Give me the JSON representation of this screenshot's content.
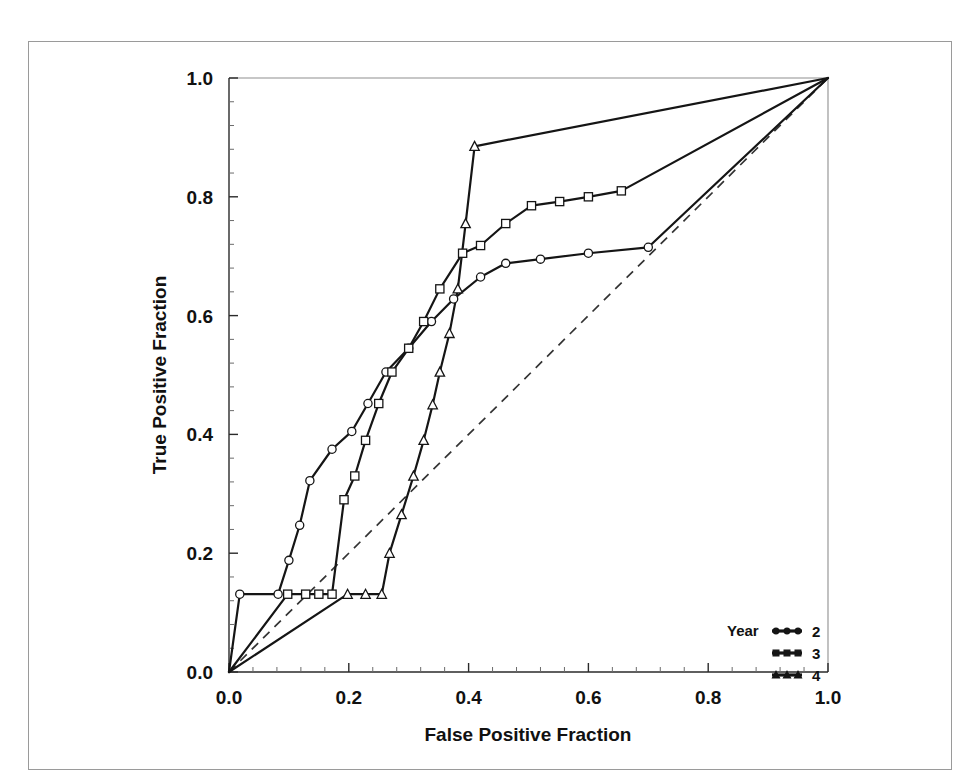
{
  "chart_data": {
    "type": "line",
    "title": "",
    "xlabel": "False Positive Fraction",
    "ylabel": "True Positive Fraction",
    "xlim": [
      0.0,
      1.0
    ],
    "ylim": [
      0.0,
      1.0
    ],
    "grid": false,
    "legend_position": "bottom-right",
    "legend_title": "Year",
    "xticks": [
      "0.0",
      "0.2",
      "0.4",
      "0.6",
      "0.8",
      "1.0"
    ],
    "xtick_values": [
      0.0,
      0.2,
      0.4,
      0.6,
      0.8,
      1.0
    ],
    "yticks": [
      "0.0",
      "0.2",
      "0.4",
      "0.6",
      "0.8",
      "1.0"
    ],
    "ytick_values": [
      0.0,
      0.2,
      0.4,
      0.6,
      0.8,
      1.0
    ],
    "minor_ticks_per_interval": 4,
    "reference_line": {
      "label": "chance-diagonal",
      "style": "dashed",
      "x": [
        0.0,
        1.0
      ],
      "y": [
        0.0,
        1.0
      ]
    },
    "series": [
      {
        "name": "2",
        "marker": "circle",
        "points": [
          [
            0.0,
            0.0
          ],
          [
            0.018,
            0.131
          ],
          [
            0.082,
            0.131
          ],
          [
            0.1,
            0.188
          ],
          [
            0.118,
            0.247
          ],
          [
            0.135,
            0.322
          ],
          [
            0.172,
            0.375
          ],
          [
            0.205,
            0.405
          ],
          [
            0.232,
            0.452
          ],
          [
            0.262,
            0.505
          ],
          [
            0.3,
            0.545
          ],
          [
            0.338,
            0.59
          ],
          [
            0.375,
            0.628
          ],
          [
            0.42,
            0.665
          ],
          [
            0.462,
            0.688
          ],
          [
            0.52,
            0.695
          ],
          [
            0.6,
            0.705
          ],
          [
            0.7,
            0.715
          ],
          [
            1.0,
            1.0
          ]
        ]
      },
      {
        "name": "3",
        "marker": "square",
        "points": [
          [
            0.0,
            0.0
          ],
          [
            0.098,
            0.131
          ],
          [
            0.128,
            0.131
          ],
          [
            0.15,
            0.131
          ],
          [
            0.172,
            0.131
          ],
          [
            0.192,
            0.29
          ],
          [
            0.21,
            0.33
          ],
          [
            0.228,
            0.39
          ],
          [
            0.25,
            0.452
          ],
          [
            0.272,
            0.505
          ],
          [
            0.3,
            0.545
          ],
          [
            0.325,
            0.59
          ],
          [
            0.352,
            0.645
          ],
          [
            0.39,
            0.705
          ],
          [
            0.42,
            0.718
          ],
          [
            0.462,
            0.755
          ],
          [
            0.505,
            0.785
          ],
          [
            0.552,
            0.792
          ],
          [
            0.6,
            0.8
          ],
          [
            0.655,
            0.81
          ],
          [
            1.0,
            1.0
          ]
        ]
      },
      {
        "name": "4",
        "marker": "triangle",
        "points": [
          [
            0.0,
            0.0
          ],
          [
            0.198,
            0.131
          ],
          [
            0.228,
            0.131
          ],
          [
            0.255,
            0.131
          ],
          [
            0.268,
            0.2
          ],
          [
            0.288,
            0.265
          ],
          [
            0.308,
            0.33
          ],
          [
            0.325,
            0.39
          ],
          [
            0.34,
            0.45
          ],
          [
            0.352,
            0.505
          ],
          [
            0.368,
            0.57
          ],
          [
            0.382,
            0.645
          ],
          [
            0.395,
            0.755
          ],
          [
            0.41,
            0.885
          ],
          [
            1.0,
            1.0
          ]
        ]
      }
    ]
  },
  "legend": {
    "title": "Year",
    "items": [
      {
        "label": "2",
        "marker": "circle"
      },
      {
        "label": "3",
        "marker": "square"
      },
      {
        "label": "4",
        "marker": "triangle"
      }
    ]
  }
}
